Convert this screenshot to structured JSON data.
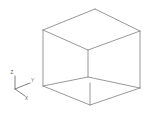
{
  "viewport": {
    "title": "3D Wireframe Cube Viewport",
    "background_color": "#ffffff",
    "width": 159,
    "height": 122
  },
  "model": {
    "name": "wireframe-cube",
    "shape": "cube",
    "edge_color": "#8c8c8c",
    "hidden_edge_color": "#a8a8a8",
    "edge_count": 12,
    "vertex_count": 8,
    "projection": "isometric",
    "vertices": {
      "top_back": [
        95,
        9
      ],
      "top_left": [
        43,
        30
      ],
      "top_right": [
        140,
        31
      ],
      "top_front": [
        88,
        50
      ],
      "bottom_back": [
        95,
        46
      ],
      "bottom_left": [
        43,
        86
      ],
      "bottom_right": [
        140,
        88
      ],
      "bottom_front": [
        90,
        105
      ]
    },
    "edges": [
      "top_back-top_left",
      "top_back-top_right",
      "top_left-top_front",
      "top_right-top_front",
      "top_left-bottom_left",
      "top_right-bottom_right",
      "top_front-bottom_front_vertical",
      "bottom_left-bottom_front",
      "bottom_right-bottom_front",
      "bottom_left-bottom_back_inner",
      "bottom_right-bottom_back_inner",
      "top_back-bottom_back_vertical"
    ]
  },
  "axis_triad": {
    "name": "coordinate-axis-indicator",
    "origin": [
      15,
      89
    ],
    "line_color": "#707070",
    "label_color": "#5a5a5a",
    "axes": [
      {
        "id": "z",
        "label": "Z",
        "tip": [
          15,
          76
        ],
        "label_pos": [
          13,
          73
        ]
      },
      {
        "id": "y",
        "label": "Y",
        "tip": [
          30,
          83
        ],
        "label_pos": [
          31.5,
          81
        ]
      },
      {
        "id": "x",
        "label": "X",
        "tip": [
          25,
          96
        ],
        "label_pos": [
          26,
          98
        ]
      }
    ]
  }
}
